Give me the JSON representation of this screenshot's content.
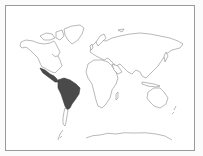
{
  "map": {
    "type": "world-outline-map",
    "title": "",
    "highlighted_region": "Latin America (Central America and South America)",
    "colors": {
      "background": "#ffffff",
      "outline": "#8a8a8a",
      "highlight": "#4a4a4a",
      "frame": "#9a9a9a"
    },
    "regions": [
      {
        "name": "North America",
        "highlighted": false
      },
      {
        "name": "Greenland",
        "highlighted": false
      },
      {
        "name": "Central America",
        "highlighted": true
      },
      {
        "name": "South America",
        "highlighted": true
      },
      {
        "name": "Europe",
        "highlighted": false
      },
      {
        "name": "Africa",
        "highlighted": false
      },
      {
        "name": "Asia",
        "highlighted": false
      },
      {
        "name": "Australia",
        "highlighted": false
      },
      {
        "name": "Antarctica",
        "highlighted": false
      }
    ]
  }
}
